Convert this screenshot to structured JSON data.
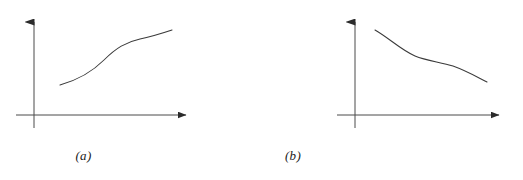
{
  "figure": {
    "background_color": "#ffffff",
    "stroke_color": "#3a3a3a",
    "axis_color": "#4a4a4a",
    "caption_color": "#1a1a1a",
    "width": 523,
    "height": 180
  },
  "panels": [
    {
      "id": "a",
      "caption": "(a)",
      "axes": {
        "origin_x": 34,
        "origin_y": 115,
        "x_axis_start_x": 16,
        "x_axis_end_x": 192,
        "y_axis_top_y": 15,
        "y_axis_bottom_y": 128,
        "x_arrow": "right",
        "y_arrow": "up"
      },
      "curve": {
        "description": "increasing S-shaped curve",
        "shape": "sigmoid-increasing",
        "path": "M 60 85 C 78 80, 92 72, 104 60 C 116 48, 126 42, 140 39 C 154 36, 163 33, 172 30"
      }
    },
    {
      "id": "b",
      "caption": "(b)",
      "axes": {
        "origin_x": 94,
        "origin_y": 115,
        "x_axis_start_x": 76,
        "x_axis_end_x": 244,
        "y_axis_top_y": 15,
        "y_axis_bottom_y": 128,
        "x_arrow": "right",
        "y_arrow": "up"
      },
      "curve": {
        "description": "decreasing curve with a flattened middle",
        "shape": "sigmoid-decreasing",
        "path": "M 114 30 C 128 38, 140 50, 154 56 C 166 61, 180 62, 192 66 C 206 71, 216 77, 226 82"
      }
    }
  ],
  "chart_data": {
    "type": "line",
    "title": "",
    "xlabel": "",
    "ylabel": "",
    "grid": false,
    "legend": null,
    "annotations": [
      "(a)",
      "(b)"
    ],
    "series": [
      {
        "name": "(a)",
        "description": "monotonically increasing S-shaped curve",
        "x": [
          0,
          1,
          2,
          3,
          4,
          5,
          6
        ],
        "values": [
          1.0,
          1.5,
          2.3,
          3.6,
          4.4,
          4.9,
          5.4
        ]
      },
      {
        "name": "(b)",
        "description": "monotonically decreasing curve with a plateau in the middle",
        "x": [
          0,
          1,
          2,
          3,
          4,
          5,
          6
        ],
        "values": [
          5.4,
          4.6,
          3.9,
          3.5,
          3.3,
          2.7,
          1.9
        ]
      }
    ]
  }
}
